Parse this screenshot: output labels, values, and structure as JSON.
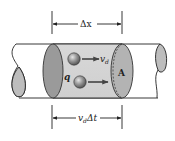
{
  "diagram": {
    "labels": {
      "delta_x": "Δx",
      "drift_velocity": "v",
      "drift_velocity_sub": "d",
      "charge": "q",
      "area": "A",
      "vd_dt_v": "v",
      "vd_dt_sub": "d",
      "vd_dt_rest": "Δt"
    },
    "colors": {
      "tube_outline": "#222222",
      "cross_section_fill": "#9a9a9a",
      "segment_fill": "#d4d4d4",
      "end_fill": "#bdbdbd",
      "sphere_fill": "#7a7a7a",
      "arrow": "#333333"
    }
  }
}
